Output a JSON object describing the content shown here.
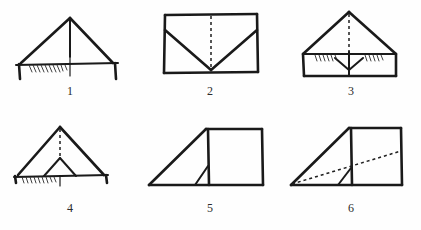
{
  "page": {
    "background_color": "#ffffff",
    "ink_color": "#1a1a1a",
    "layout": "2 rows x 3 columns",
    "figure_count": 6
  },
  "figures": [
    {
      "id": "figure-1",
      "label": "1",
      "description": "Tent shape: wide triangle with vertical center crease, horizontal base line, hatch shading on left of base, short vertical end flaps"
    },
    {
      "id": "figure-2",
      "label": "2",
      "description": "Rectangle with dashed vertical center crease and solid V fold lines from upper left and upper right corners meeting at bottom center"
    },
    {
      "id": "figure-3",
      "label": "3",
      "description": "Triangle above a rectangle with dashed vertical crease, small inverted triangle flap at center and hatch shading along the horizontal seam"
    },
    {
      "id": "figure-4",
      "label": "4",
      "description": "Triangle with dashed vertical crease, small inner triangle resting on the base, hatch shading along the left half of the base"
    },
    {
      "id": "figure-5",
      "label": "5",
      "description": "Side view: long slanted edge rising to the right, upright rectangle panel at right, small triangular flap at bottom"
    },
    {
      "id": "figure-6",
      "label": "6",
      "description": "Same side view as figure 5 with an added dashed diagonal fold line from the bottom left corner up to the right edge"
    }
  ]
}
